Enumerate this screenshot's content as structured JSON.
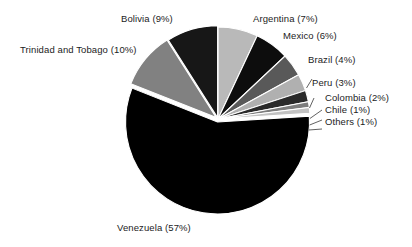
{
  "chart_data": {
    "type": "pie",
    "title": "",
    "subtitle": "",
    "xlabel": "",
    "ylabel": "",
    "legend_position": "none",
    "grid": false,
    "labels_show_percent": true,
    "categories": [
      "Argentina",
      "Mexico",
      "Brazil",
      "Peru",
      "Colombia",
      "Chile",
      "Others",
      "Venezuela",
      "Trinidad and Tobago",
      "Bolivia"
    ],
    "values": [
      7,
      6,
      4,
      3,
      2,
      1,
      1,
      57,
      10,
      9
    ],
    "slice_colors": [
      "#b9b9b9",
      "#0d0d0d",
      "#595959",
      "#b0b0b0",
      "#2a2a2a",
      "#7d7d7d",
      "#c2c2c2",
      "#000000",
      "#818181",
      "#171717"
    ],
    "slices": [
      {
        "name": "Argentina",
        "percent": 7,
        "label": "Argentina (7%)",
        "color": "#b9b9b9"
      },
      {
        "name": "Mexico",
        "percent": 6,
        "label": "Mexico (6%)",
        "color": "#0d0d0d"
      },
      {
        "name": "Brazil",
        "percent": 4,
        "label": "Brazil (4%)",
        "color": "#595959"
      },
      {
        "name": "Peru",
        "percent": 3,
        "label": "Peru (3%)",
        "color": "#b0b0b0"
      },
      {
        "name": "Colombia",
        "percent": 2,
        "label": "Colombia (2%)",
        "color": "#2a2a2a"
      },
      {
        "name": "Chile",
        "percent": 1,
        "label": "Chile (1%)",
        "color": "#7d7d7d"
      },
      {
        "name": "Others",
        "percent": 1,
        "label": "Others (1%)",
        "color": "#c2c2c2"
      },
      {
        "name": "Venezuela",
        "percent": 57,
        "label": "Venezuela (57%)",
        "color": "#000000"
      },
      {
        "name": "Trinidad and Tobago",
        "percent": 10,
        "label": "Trinidad and Tobago (10%)",
        "color": "#818181"
      },
      {
        "name": "Bolivia",
        "percent": 9,
        "label": "Bolivia (9%)",
        "color": "#171717"
      }
    ],
    "total_percent": 100,
    "units": "%"
  },
  "labels": {
    "bolivia": "Bolivia (9%)",
    "argentina": "Argentina (7%)",
    "mexico": "Mexico (6%)",
    "trinidad": "Trinidad and Tobago (10%)",
    "brazil": "Brazil (4%)",
    "peru": "Peru (3%)",
    "colombia": "Colombia (2%)",
    "chile": "Chile (1%)",
    "others": "Others (1%)",
    "venezuela": "Venezuela (57%)"
  }
}
